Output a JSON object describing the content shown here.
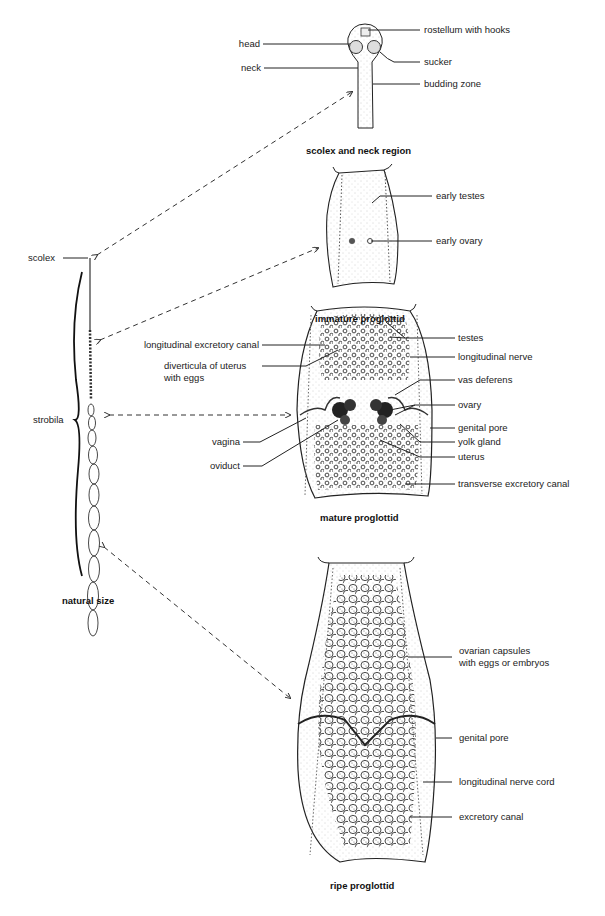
{
  "figure": {
    "panels": [
      {
        "id": "scolex_neck",
        "caption": "scolex and neck region",
        "labels": {
          "head": "head",
          "neck": "neck",
          "rostellum": "rostellum with hooks",
          "sucker": "sucker",
          "budding_zone": "budding zone"
        }
      },
      {
        "id": "immature",
        "caption": "immature proglottid",
        "labels": {
          "early_testes": "early testes",
          "early_ovary": "early ovary"
        }
      },
      {
        "id": "mature",
        "caption": "mature proglottid",
        "labels": {
          "long_excretory_canal": "longitudinal excretory canal",
          "diverticula_1": "diverticula of uterus",
          "diverticula_2": "with eggs",
          "vagina": "vagina",
          "oviduct": "oviduct",
          "testes": "testes",
          "long_nerve": "longitudinal nerve",
          "vas_deferens": "vas deferens",
          "ovary": "ovary",
          "genital_pore": "genital pore",
          "yolk_gland": "yolk gland",
          "uterus": "uterus",
          "transverse_canal": "transverse excretory canal"
        }
      },
      {
        "id": "ripe",
        "caption": "ripe proglottid",
        "labels": {
          "ovarian_capsules_1": "ovarian capsules",
          "ovarian_capsules_2": "with eggs or embryos",
          "genital_pore": "genital pore",
          "long_nerve_cord": "longitudinal nerve cord",
          "excretory_canal": "excretory canal"
        }
      },
      {
        "id": "whole_worm",
        "caption": "natural size",
        "labels": {
          "scolex": "scolex",
          "strobila": "strobila"
        }
      }
    ]
  }
}
